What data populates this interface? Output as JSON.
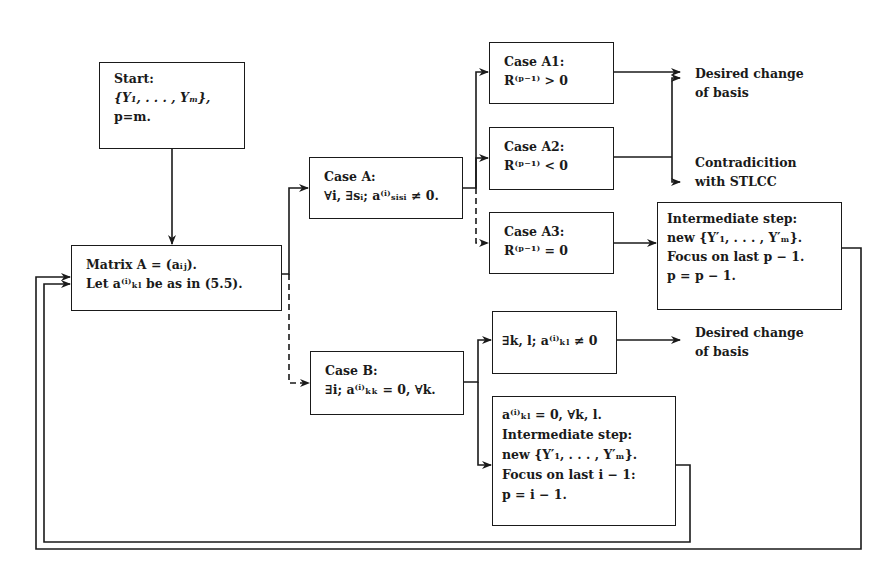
{
  "diagram": {
    "type": "flowchart",
    "nodes": {
      "start": {
        "lines": [
          "Start:",
          "{Y₁, . . . , Yₘ},",
          "p=m."
        ]
      },
      "matrix": {
        "lines": [
          "Matrix A = (aᵢⱼ).",
          "Let a⁽ⁱ⁾ₖₗ be as in (5.5)."
        ]
      },
      "case_a": {
        "lines": [
          "Case A:",
          "∀i, ∃sᵢ; a⁽ⁱ⁾ₛᵢₛᵢ ≠ 0."
        ]
      },
      "case_a1": {
        "lines": [
          "Case A1:",
          "R⁽ᵖ⁻¹⁾ > 0"
        ]
      },
      "case_a2": {
        "lines": [
          "Case A2:",
          "R⁽ᵖ⁻¹⁾ < 0"
        ]
      },
      "case_a3": {
        "lines": [
          "Case A3:",
          "R⁽ᵖ⁻¹⁾ = 0"
        ]
      },
      "intermediate_a": {
        "lines": [
          "Intermediate step:",
          "new {Y′₁, . . . , Y′ₘ}.",
          "Focus on last p − 1.",
          "p = p − 1."
        ]
      },
      "case_b": {
        "lines": [
          "Case B:",
          "∃i; a⁽ⁱ⁾ₖₖ = 0, ∀k."
        ]
      },
      "case_b1": {
        "lines": [
          "∃k, l; a⁽ⁱ⁾ₖₗ ≠ 0"
        ]
      },
      "case_b2": {
        "lines": [
          "a⁽ⁱ⁾ₖₗ = 0, ∀k, l.",
          "Intermediate step:",
          "new {Y′₁, . . . , Y′ₘ}.",
          "Focus on last i − 1:",
          "p = i − 1."
        ]
      }
    },
    "outcomes": {
      "desired_a": {
        "lines": [
          "Desired change",
          "of basis"
        ]
      },
      "contradiction": {
        "lines": [
          "Contradicition",
          "with STLCC"
        ]
      },
      "desired_b": {
        "lines": [
          "Desired change",
          "of basis"
        ]
      }
    },
    "edges": [
      {
        "from": "start",
        "to": "matrix",
        "style": "solid"
      },
      {
        "from": "matrix",
        "to": "case_a",
        "style": "solid"
      },
      {
        "from": "matrix",
        "to": "case_b",
        "style": "dashed"
      },
      {
        "from": "case_a",
        "to": "case_a1",
        "style": "solid"
      },
      {
        "from": "case_a",
        "to": "case_a2",
        "style": "solid"
      },
      {
        "from": "case_a",
        "to": "case_a3",
        "style": "dashed"
      },
      {
        "from": "case_a1",
        "to": "desired_a",
        "style": "solid"
      },
      {
        "from": "case_a2",
        "to": "desired_a",
        "style": "solid"
      },
      {
        "from": "case_a2",
        "to": "contradiction",
        "style": "solid"
      },
      {
        "from": "case_a3",
        "to": "intermediate_a",
        "style": "solid"
      },
      {
        "from": "intermediate_a",
        "to": "matrix",
        "style": "solid"
      },
      {
        "from": "case_b",
        "to": "case_b1",
        "style": "solid"
      },
      {
        "from": "case_b",
        "to": "case_b2",
        "style": "solid"
      },
      {
        "from": "case_b1",
        "to": "desired_b",
        "style": "solid"
      },
      {
        "from": "case_b2",
        "to": "matrix",
        "style": "solid"
      }
    ],
    "line_color": "#1a1a1a",
    "background": "#ffffff"
  }
}
